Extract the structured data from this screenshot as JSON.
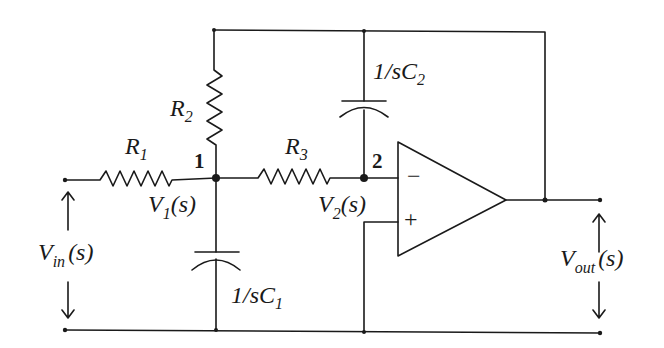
{
  "diagram": {
    "type": "circuit-schematic",
    "components": {
      "R1": {
        "label": "R",
        "sub": "1"
      },
      "R2": {
        "label": "R",
        "sub": "2"
      },
      "R3": {
        "label": "R",
        "sub": "3"
      },
      "C1": {
        "label": "1/sC",
        "sub": "1"
      },
      "C2": {
        "label": "1/sC",
        "sub": "2"
      }
    },
    "nodes": {
      "n1": {
        "label": "1",
        "voltage_main": "V",
        "voltage_sub": "1",
        "voltage_arg": "(s)"
      },
      "n2": {
        "label": "2",
        "voltage_main": "V",
        "voltage_sub": "2",
        "voltage_arg": "(s)"
      }
    },
    "opamp": {
      "inverting": "−",
      "noninverting": "+"
    },
    "ports": {
      "input": {
        "main": "V",
        "sub": "in",
        "arg": "(s)"
      },
      "output": {
        "main": "V",
        "sub": "out",
        "arg": "(s)"
      }
    },
    "colors": {
      "line": "#1a1a1a",
      "background": "#ffffff"
    }
  }
}
